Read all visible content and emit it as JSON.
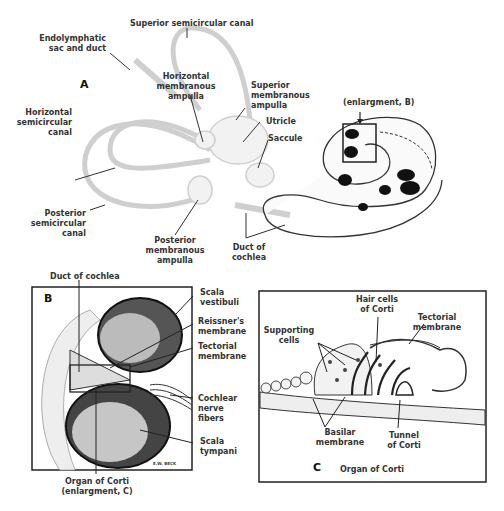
{
  "panel_a": {
    "letter": "A",
    "labels": {
      "superior_semicircular_canal": "Superior semicircular canal",
      "endolymphatic_1": "Endolymphatic",
      "endolymphatic_2": "sac and duct",
      "horizontal_ampulla_1": "Horizontal",
      "horizontal_ampulla_2": "membranous",
      "horizontal_ampulla_3": "ampulla",
      "superior_ampulla_1": "Superior",
      "superior_ampulla_2": "membranous",
      "superior_ampulla_3": "ampulla",
      "utricle": "Utricle",
      "saccule": "Saccule",
      "horizontal_canal_1": "Horizontal",
      "horizontal_canal_2": "semicircular",
      "horizontal_canal_3": "canal",
      "posterior_canal_1": "Posterior",
      "posterior_canal_2": "semicircular",
      "posterior_canal_3": "canal",
      "posterior_ampulla_1": "Posterior",
      "posterior_ampulla_2": "membranous",
      "posterior_ampulla_3": "ampulla",
      "duct_of_cochlea_1": "Duct of",
      "duct_of_cochlea_2": "cochlea",
      "enlargement_b": "(enlargment, B)"
    }
  },
  "panel_b": {
    "letter": "B",
    "labels": {
      "duct_of_cochlea": "Duct of cochlea",
      "scala_vestibuli_1": "Scala",
      "scala_vestibuli_2": "vestibuli",
      "reissners_1": "Reissner's",
      "reissners_2": "membrane",
      "tectorial_1": "Tectorial",
      "tectorial_2": "membrane",
      "cochlear_nerve_1": "Cochlear",
      "cochlear_nerve_2": "nerve",
      "cochlear_nerve_3": "fibers",
      "scala_tympani_1": "Scala",
      "scala_tympani_2": "tympani",
      "organ_of_corti_1": "Organ of Corti",
      "organ_of_corti_2": "(enlargment, C)",
      "signature": "E.W. BECK"
    }
  },
  "panel_c": {
    "letter": "C",
    "title": "Organ of Corti",
    "labels": {
      "hair_cells_1": "Hair cells",
      "hair_cells_2": "of Corti",
      "tectorial_1": "Tectorial",
      "tectorial_2": "membrane",
      "supporting_1": "Supporting",
      "supporting_2": "cells",
      "basilar_1": "Basilar",
      "basilar_2": "membrane",
      "tunnel_1": "Tunnel",
      "tunnel_2": "of Corti"
    }
  }
}
